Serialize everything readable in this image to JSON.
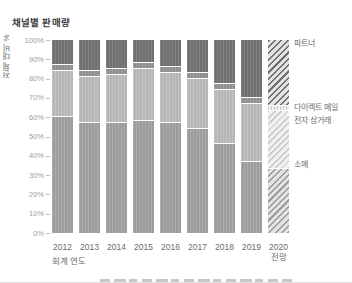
{
  "title": "채널별 판매량",
  "y_axis": {
    "label": "전체 대비 %",
    "tick_labels": [
      "0%",
      "10%",
      "20%",
      "30%",
      "40%",
      "50%",
      "60%",
      "70%",
      "80%",
      "90%",
      "100%"
    ]
  },
  "x_axis": {
    "label": "회계 연도",
    "tick_labels": [
      "2012",
      "2013",
      "2014",
      "2015",
      "2016",
      "2017",
      "2018",
      "2019",
      "2020 전망"
    ]
  },
  "legend": {
    "position": "right",
    "items": [
      "파트너",
      "다이렉트 메일",
      "전자 상거래",
      "소매"
    ]
  },
  "colors": {
    "partner": "#6f6f6f",
    "direct_mail": "#8f8f8f",
    "ecommerce": "#b6b6b6",
    "retail": "#9c9c9c",
    "tick": "#bdbdbd",
    "tick_text": "#9e9e9e",
    "axis_text": "#6b6b6b",
    "title_text": "#3d3d3d"
  },
  "chart_data": {
    "type": "bar",
    "stacked": true,
    "orientation": "vertical",
    "title": "채널별 판매량",
    "xlabel": "회계 연도",
    "ylabel": "전체 대비 %",
    "ylim": [
      0,
      100
    ],
    "y_unit": "%",
    "grid": false,
    "legend_position": "right",
    "categories": [
      "2012",
      "2013",
      "2014",
      "2015",
      "2016",
      "2017",
      "2018",
      "2019",
      "2020 전망"
    ],
    "forecast_category": "2020 전망",
    "series": [
      {
        "name": "소매",
        "values": [
          60,
          57,
          57,
          58,
          57,
          54,
          46,
          37,
          33
        ]
      },
      {
        "name": "전자 상거래",
        "values": [
          24,
          24,
          25,
          27,
          26,
          26,
          28,
          30,
          30
        ]
      },
      {
        "name": "다이렉트 메일",
        "values": [
          3,
          3,
          3,
          3,
          3,
          3,
          3,
          3,
          3
        ]
      },
      {
        "name": "파트너",
        "values": [
          13,
          16,
          15,
          12,
          14,
          17,
          23,
          30,
          34
        ]
      }
    ]
  }
}
